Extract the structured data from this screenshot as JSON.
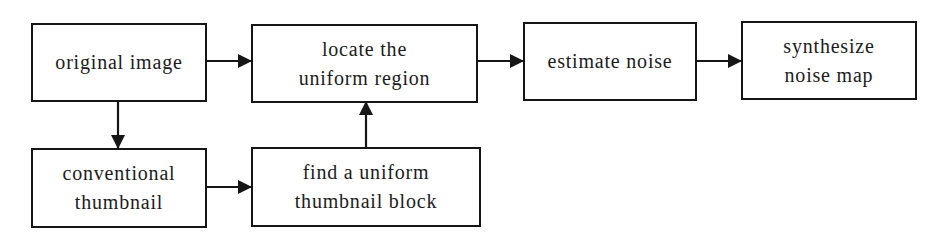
{
  "diagram": {
    "type": "flowchart",
    "nodes": [
      {
        "id": "original_image",
        "lines": [
          "original image"
        ]
      },
      {
        "id": "locate_uniform_region",
        "lines": [
          "locate the",
          "uniform region"
        ]
      },
      {
        "id": "estimate_noise",
        "lines": [
          "estimate noise"
        ]
      },
      {
        "id": "synthesize_noise_map",
        "lines": [
          "synthesize",
          "noise map"
        ]
      },
      {
        "id": "conventional_thumbnail",
        "lines": [
          "conventional",
          "thumbnail"
        ]
      },
      {
        "id": "find_uniform_thumbnail_block",
        "lines": [
          "find a uniform",
          "thumbnail block"
        ]
      }
    ],
    "edges": [
      {
        "from": "original_image",
        "to": "locate_uniform_region"
      },
      {
        "from": "locate_uniform_region",
        "to": "estimate_noise"
      },
      {
        "from": "estimate_noise",
        "to": "synthesize_noise_map"
      },
      {
        "from": "original_image",
        "to": "conventional_thumbnail"
      },
      {
        "from": "conventional_thumbnail",
        "to": "find_uniform_thumbnail_block"
      },
      {
        "from": "find_uniform_thumbnail_block",
        "to": "locate_uniform_region"
      }
    ],
    "colors": {
      "stroke": "#161616",
      "text": "#1c1c1c",
      "background": "#ffffff"
    }
  }
}
